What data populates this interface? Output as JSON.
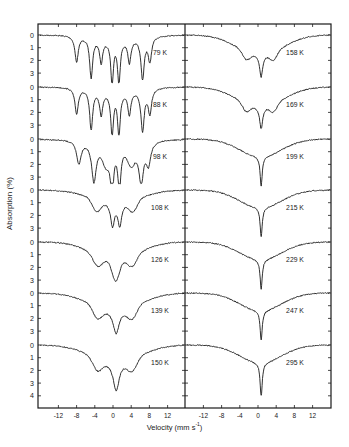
{
  "chart_data": {
    "type": "line",
    "title": "",
    "xlabel": "Velocity (mm s^-1)",
    "ylabel": "Absorption (%)",
    "xlim": [
      -16,
      16
    ],
    "x_ticks": [
      -12,
      -8,
      -4,
      0,
      4,
      8,
      12
    ],
    "y_ticks_per_spectrum": [
      0,
      1,
      2,
      3
    ],
    "y_ticks_last_spectrum": [
      0,
      1,
      2,
      3,
      4
    ],
    "grid": false,
    "layout": "two stacked panels (left: 79–150 K, right: 158–295 K), seven offset Mössbauer spectra per panel",
    "panels": [
      {
        "name": "left",
        "spectra": [
          {
            "label": "79 K",
            "shape": "six-line magnetic sextet",
            "lines_velocity": [
              -8.0,
              -4.5,
              -2.5,
              0.0,
              2.0,
              3.8,
              6.5,
              8.0
            ],
            "max_absorption": 3.4
          },
          {
            "label": "88 K",
            "shape": "six-line magnetic sextet",
            "lines_velocity": [
              -8.0,
              -4.5,
              -2.5,
              0.0,
              2.0,
              3.8,
              6.5,
              8.0
            ],
            "max_absorption": 3.4
          },
          {
            "label": "98 K",
            "shape": "collapsing sextet, central doublet",
            "lines_velocity": [
              -7.5,
              -4.0,
              0.0,
              2.0,
              6.0,
              7.5
            ],
            "max_absorption": 3.5
          },
          {
            "label": "108 K",
            "shape": "broadened sextet with central doublet",
            "lines_velocity": [
              -7.0,
              -3.5,
              0.0,
              2.0,
              5.0,
              7.0
            ],
            "max_absorption": 3.9
          },
          {
            "label": "126 K",
            "shape": "broad relaxation, central doublet",
            "lines_velocity": [
              -3.5,
              0.0,
              2.0,
              4.0
            ],
            "max_absorption": 3.9
          },
          {
            "label": "139 K",
            "shape": "broad relaxation, central line",
            "lines_velocity": [
              -3.5,
              0.8,
              4.0
            ],
            "max_absorption": 3.7
          },
          {
            "label": "150 K",
            "shape": "broad relaxation, central line",
            "lines_velocity": [
              -3.5,
              0.8,
              4.0
            ],
            "max_absorption": 4.0
          }
        ]
      },
      {
        "name": "right",
        "spectra": [
          {
            "label": "158 K",
            "shape": "broad shoulders + central line",
            "lines_velocity": [
              -3.0,
              0.8,
              3.5
            ],
            "max_absorption": 3.5
          },
          {
            "label": "169 K",
            "shape": "broad shoulders + central line",
            "lines_velocity": [
              -3.0,
              0.8,
              3.5
            ],
            "max_absorption": 3.5
          },
          {
            "label": "199 K",
            "shape": "broad background + sharp central line",
            "lines_velocity": [
              0.8
            ],
            "max_absorption": 3.5
          },
          {
            "label": "215 K",
            "shape": "broad background + sharp central line",
            "lines_velocity": [
              0.8
            ],
            "max_absorption": 3.8
          },
          {
            "label": "229 K",
            "shape": "broad background + sharp central line",
            "lines_velocity": [
              0.8
            ],
            "max_absorption": 3.8
          },
          {
            "label": "247 K",
            "shape": "broad background + sharp central line",
            "lines_velocity": [
              0.8
            ],
            "max_absorption": 3.6
          },
          {
            "label": "295 K",
            "shape": "broad background + sharp central line",
            "lines_velocity": [
              0.6
            ],
            "max_absorption": 4.0
          }
        ]
      }
    ]
  },
  "axes": {
    "ylabel": "Absorption (%)",
    "xlabel_main": "Velocity (mm s",
    "xlabel_sup": "-1",
    "xlabel_end": ")",
    "x_tick_labels": [
      "-12",
      "-8",
      "-4",
      "0",
      "4",
      "8",
      "12"
    ],
    "y_tick_labels": [
      "0",
      "1",
      "2",
      "3"
    ],
    "y_tick_labels_last": [
      "0",
      "1",
      "2",
      "3",
      "4"
    ]
  },
  "style": {
    "ink": "#1a1a1a",
    "background": "#ffffff"
  }
}
